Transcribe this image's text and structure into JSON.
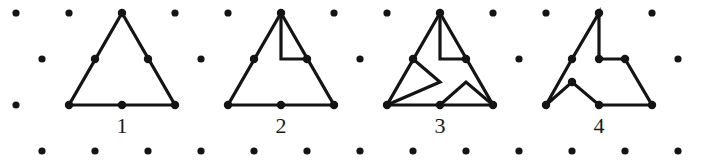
{
  "figure": {
    "width": 708,
    "height": 165,
    "background_color": "#ffffff",
    "ink_color": "#141414",
    "dot_color": "#141414",
    "stroke_width": 3.2,
    "dot_radius": 3.6
  },
  "lattice": {
    "description": "staggered triangular dot grid, 4 rows",
    "rows": [
      {
        "y": 13,
        "xs": [
          16,
          69,
          122,
          175,
          228,
          281,
          334,
          387,
          440,
          493,
          546,
          599,
          652
        ]
      },
      {
        "y": 59,
        "xs": [
          42,
          95,
          148,
          201,
          254,
          307,
          360,
          413,
          466,
          519,
          572,
          625,
          678
        ]
      },
      {
        "y": 105,
        "xs": [
          16,
          69,
          122,
          175,
          228,
          281,
          334,
          387,
          440,
          493,
          546,
          599,
          652
        ]
      },
      {
        "y": 151,
        "xs": [
          42,
          95,
          148,
          201,
          254,
          307,
          360,
          413,
          466,
          519,
          572,
          625,
          678
        ]
      }
    ]
  },
  "shapes": [
    {
      "name": "figure-1-plain-triangle",
      "label": "1",
      "label_x": 122,
      "label_y": 115,
      "closed": true,
      "points": [
        [
          122,
          13
        ],
        [
          175,
          105
        ],
        [
          69,
          105
        ]
      ],
      "marked_points": [
        [
          122,
          13
        ],
        [
          175,
          105
        ],
        [
          69,
          105
        ],
        [
          148,
          59
        ],
        [
          95,
          59
        ],
        [
          122,
          105
        ]
      ],
      "extra_paths": []
    },
    {
      "name": "figure-2-triangle-one-notch",
      "label": "2",
      "label_x": 281,
      "label_y": 115,
      "closed": true,
      "points": [
        [
          281,
          13
        ],
        [
          334,
          105
        ],
        [
          228,
          105
        ]
      ],
      "marked_points": [
        [
          281,
          13
        ],
        [
          334,
          105
        ],
        [
          228,
          105
        ],
        [
          307,
          59
        ],
        [
          254,
          59
        ],
        [
          281,
          105
        ]
      ],
      "extra_paths": [
        {
          "name": "notch-top-right",
          "points": [
            [
              281,
              13
            ],
            [
              281,
              59
            ],
            [
              307,
              59
            ]
          ],
          "closed": false
        }
      ]
    },
    {
      "name": "figure-3-triangle-three-notches",
      "label": "3",
      "label_x": 440,
      "label_y": 115,
      "closed": true,
      "points": [
        [
          440,
          13
        ],
        [
          493,
          105
        ],
        [
          387,
          105
        ]
      ],
      "marked_points": [
        [
          440,
          13
        ],
        [
          493,
          105
        ],
        [
          387,
          105
        ],
        [
          466,
          59
        ],
        [
          413,
          59
        ],
        [
          440,
          105
        ]
      ],
      "extra_paths": [
        {
          "name": "notch-top-right",
          "points": [
            [
              440,
              13
            ],
            [
              440,
              59
            ],
            [
              466,
              59
            ]
          ],
          "closed": false
        },
        {
          "name": "notch-left",
          "points": [
            [
              413,
              59
            ],
            [
              440,
              82
            ],
            [
              387,
              105
            ]
          ],
          "closed": false
        },
        {
          "name": "notch-bottom",
          "points": [
            [
              440,
              105
            ],
            [
              466,
              82
            ],
            [
              493,
              105
            ]
          ],
          "closed": false
        }
      ]
    },
    {
      "name": "figure-4-pinwheel",
      "label": "4",
      "label_x": 599,
      "label_y": 115,
      "closed": true,
      "points": [
        [
          599,
          13
        ],
        [
          599,
          59
        ],
        [
          625,
          59
        ],
        [
          652,
          105
        ],
        [
          599,
          105
        ],
        [
          572,
          82
        ],
        [
          546,
          105
        ],
        [
          572,
          59
        ]
      ],
      "marked_points": [
        [
          599,
          13
        ],
        [
          599,
          59
        ],
        [
          625,
          59
        ],
        [
          652,
          105
        ],
        [
          599,
          105
        ],
        [
          572,
          82
        ],
        [
          546,
          105
        ],
        [
          572,
          59
        ]
      ],
      "extra_paths": []
    }
  ]
}
